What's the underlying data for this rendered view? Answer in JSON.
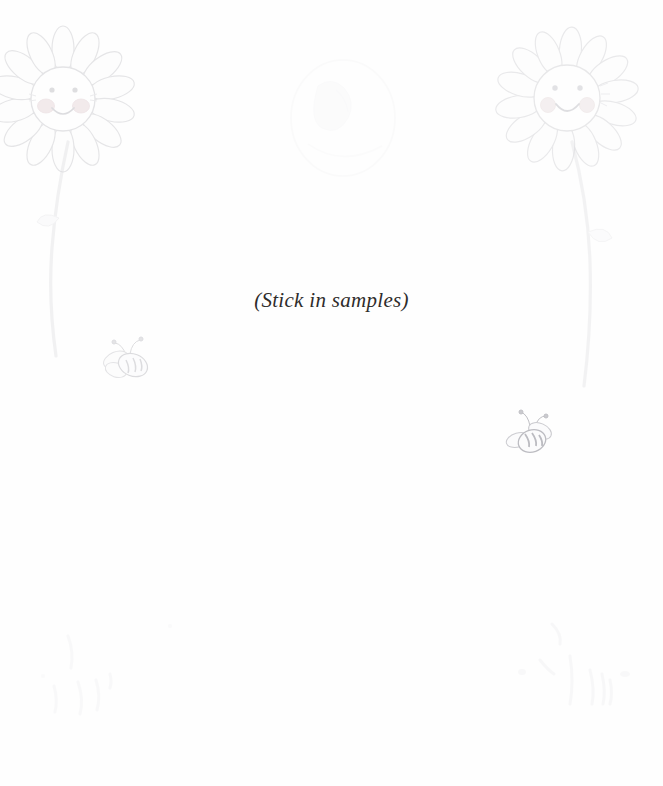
{
  "page": {
    "width": 663,
    "height": 786,
    "background_color": "#fefefe",
    "kind": "scanned-scrapbook-page"
  },
  "caption": {
    "text": "(Stick in samples)",
    "color": "#2e2c2b",
    "style": "italic-serif"
  },
  "decorations": {
    "flower_left": {
      "name": "smiling-daisy",
      "petal_count": 14,
      "has_face": true,
      "face_parts": [
        "eye",
        "eye",
        "cheek",
        "cheek",
        "smile"
      ],
      "color": "#c9c9cd"
    },
    "flower_right": {
      "name": "smiling-daisy",
      "petal_count": 14,
      "has_face": true,
      "face_parts": [
        "eye",
        "eye",
        "cheek",
        "cheek",
        "smile"
      ],
      "color": "#cdcdd1"
    },
    "stem_left": {
      "name": "flower-stem",
      "color": "#d4d4d8"
    },
    "stem_right": {
      "name": "flower-stem",
      "color": "#d6d6da"
    },
    "bee_left": {
      "name": "bee",
      "color": "#c4c4c8",
      "stripes": 3
    },
    "bee_right": {
      "name": "bee",
      "color": "#b0b0b6",
      "stripes": 3
    },
    "smudge_top": {
      "name": "bleed-through-smudge",
      "color": "#e6e6e8"
    },
    "grass_left": {
      "name": "grass-strokes",
      "color": "#e0e0e3",
      "stroke_count": 5
    },
    "grass_right": {
      "name": "grass-strokes",
      "color": "#dedee2",
      "stroke_count": 6
    }
  }
}
